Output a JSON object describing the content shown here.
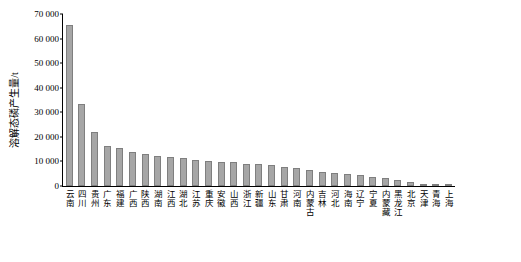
{
  "chart_data": {
    "type": "bar",
    "title": "",
    "xlabel": "",
    "ylabel": "溶解态磷产生量/t",
    "ylim": [
      0,
      70000
    ],
    "yticks": [
      0,
      10000,
      20000,
      30000,
      40000,
      50000,
      60000,
      70000
    ],
    "ytick_labels": [
      "0",
      "10 000",
      "20 000",
      "30 000",
      "40 000",
      "50 000",
      "60 000",
      "70 000"
    ],
    "grid": false,
    "legend": null,
    "categories": [
      "云南",
      "四川",
      "贵州",
      "广东",
      "福建",
      "广西",
      "陕西",
      "湖南",
      "江西",
      "湖北",
      "江苏",
      "重庆",
      "安徽",
      "山西",
      "浙江",
      "新疆",
      "山东",
      "甘肃",
      "河南",
      "内蒙古",
      "吉林",
      "河北",
      "海南",
      "辽宁",
      "宁夏",
      "内蒙藏",
      "黑龙江",
      "北京",
      "天津",
      "青海",
      "上海"
    ],
    "values": [
      65500,
      33200,
      21800,
      16400,
      15400,
      14000,
      13200,
      12400,
      11800,
      11200,
      10700,
      10300,
      9900,
      9600,
      9100,
      8800,
      8400,
      7800,
      7300,
      6600,
      5600,
      5300,
      4700,
      4300,
      3600,
      3100,
      2400,
      1600,
      1000,
      600,
      300
    ]
  },
  "style": {
    "bar_fill": "#a6a6a6",
    "bar_stroke": "#7f7f7f",
    "axis_color": "#000000",
    "background": "#ffffff"
  }
}
